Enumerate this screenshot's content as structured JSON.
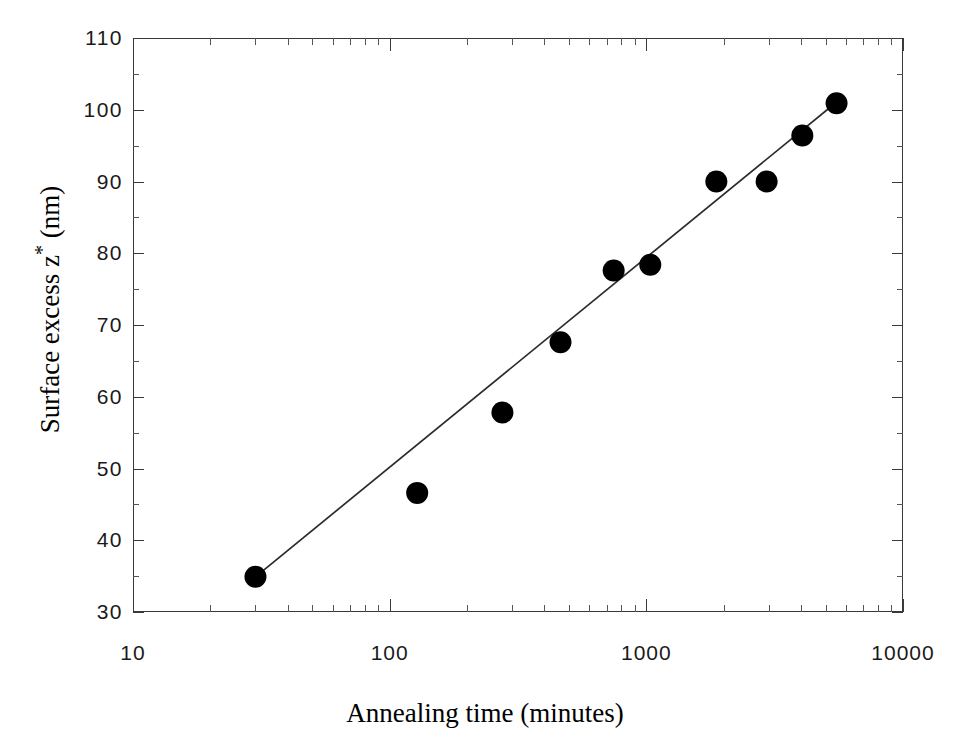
{
  "figure": {
    "top_fragment_text": "",
    "background_color": "#ffffff",
    "marker_color": "#000000",
    "line_color": "#2b2b2b",
    "axis_color": "#3a3a3a"
  },
  "chart_data": {
    "type": "scatter",
    "title": "",
    "xlabel": "Annealing time (minutes)",
    "ylabel": "Surface excess z* (nm)",
    "xscale": "log",
    "yscale": "linear",
    "xlim": [
      10,
      10000
    ],
    "ylim": [
      30,
      110
    ],
    "grid": false,
    "legend": null,
    "x_tick_labels": [
      "10",
      "100",
      "1000",
      "10000"
    ],
    "x_tick_values": [
      10,
      100,
      1000,
      10000
    ],
    "y_tick_labels": [
      "30",
      "40",
      "50",
      "60",
      "70",
      "80",
      "90",
      "100",
      "110"
    ],
    "y_tick_values": [
      30,
      40,
      50,
      60,
      70,
      80,
      90,
      100,
      110
    ],
    "series": [
      {
        "name": "Surface excess vs annealing time",
        "marker": "filled-circle",
        "x": [
          30,
          128,
          275,
          463,
          746,
          1036,
          1874,
          2942,
          4053,
          5510
        ],
        "y": [
          34.9,
          46.6,
          57.8,
          67.6,
          77.6,
          78.4,
          90.0,
          90.0,
          96.4,
          100.9
        ]
      },
      {
        "name": "fit line",
        "marker": "line",
        "x": [
          30,
          5700
        ],
        "y": [
          34.9,
          101.5
        ]
      }
    ]
  }
}
